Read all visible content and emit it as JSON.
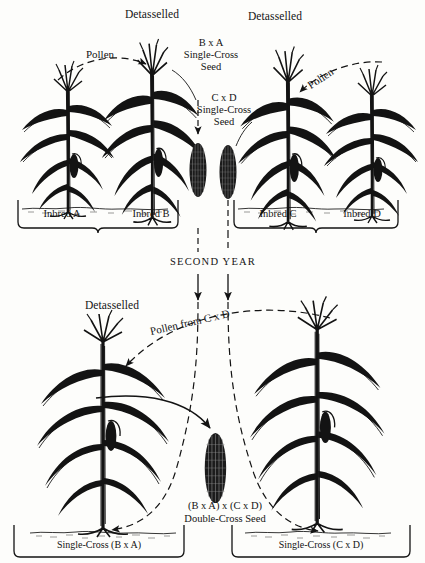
{
  "figure": {
    "domain_note": "double-cross hybrid corn seed production diagram",
    "background_color": "#fdfdfb",
    "ink_color": "#131313"
  },
  "first_year": {
    "left_block": {
      "detasselled_label": "Detasselled",
      "pollen_label": "Pollen",
      "seed_label_line1": "B x A",
      "seed_label_line2": "Single-Cross",
      "seed_label_line3": "Seed",
      "plants": [
        {
          "label": "Inbred A",
          "role": "pollen-parent"
        },
        {
          "label": "Inbred B",
          "role": "seed-parent-detasselled"
        }
      ]
    },
    "right_block": {
      "detasselled_label": "Detasselled",
      "pollen_label": "Pollen",
      "seed_label_line1": "C x D",
      "seed_label_line2": "Single-Cross",
      "seed_label_line3": "Seed",
      "plants": [
        {
          "label": "Inbred C",
          "role": "seed-parent-detasselled"
        },
        {
          "label": "Inbred D",
          "role": "pollen-parent"
        }
      ]
    }
  },
  "transition": {
    "year_label": "SECOND YEAR"
  },
  "second_year": {
    "detasselled_label": "Detasselled",
    "pollen_label": "Pollen from C x D",
    "seed_label_line1": "(B x A) x (C x D)",
    "seed_label_line2": "Double-Cross Seed",
    "panels": [
      {
        "label": "Single-Cross  (B x A)",
        "role": "seed-parent-detasselled"
      },
      {
        "label": "Single-Cross (C x D)",
        "role": "pollen-parent"
      }
    ]
  },
  "icons": {
    "corn_ear": "corn-ear-icon",
    "corn_plant": "corn-plant-icon",
    "tassel": "tassel-icon",
    "arrow_down": "arrow-down-icon",
    "brace": "brace-bracket-icon"
  }
}
